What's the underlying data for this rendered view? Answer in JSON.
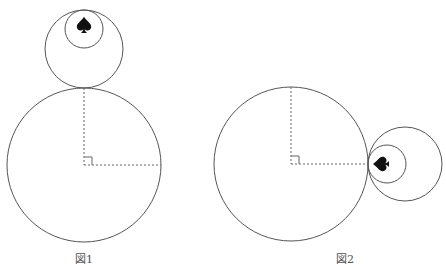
{
  "figures": [
    {
      "id": "fig1",
      "caption": "図1",
      "description": "Large circle with a medium circle resting on top (tangent at top), small circle inside medium circle containing an upright spade",
      "large_circle": {
        "cx": 84,
        "cy": 165,
        "r": 77
      },
      "medium_circle": {
        "cx": 84,
        "cy": 49,
        "r": 39
      },
      "small_circle": {
        "cx": 84,
        "cy": 29,
        "r": 19
      },
      "spade": {
        "x": 84,
        "y": 25,
        "rotation_deg": 0
      },
      "radius_lines": [
        "vertical from center to top tangent point",
        "horizontal from center to right edge"
      ],
      "right_angle_marker": true
    },
    {
      "id": "fig2",
      "caption": "図2",
      "description": "Large circle with a medium circle tangent at its right side, small circle inside medium circle containing a spade rotated to point left",
      "large_circle": {
        "cx": 291,
        "cy": 164,
        "r": 77
      },
      "medium_circle": {
        "cx": 405,
        "cy": 164,
        "r": 37
      },
      "small_circle": {
        "cx": 387,
        "cy": 164,
        "r": 19
      },
      "spade": {
        "x": 381,
        "y": 164,
        "rotation_deg": -90
      },
      "radius_lines": [
        "vertical from center to top edge",
        "horizontal from center to right tangent point"
      ],
      "right_angle_marker": true
    }
  ],
  "labels": {
    "fig1": "図1",
    "fig2": "図2"
  },
  "colors": {
    "stroke": "#555555",
    "spade": "#111111",
    "background": "#ffffff"
  }
}
